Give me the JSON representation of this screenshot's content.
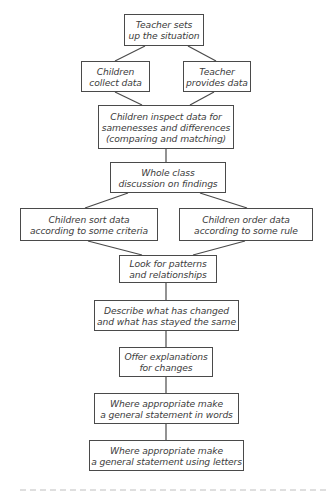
{
  "diagram": {
    "type": "flowchart",
    "colors": {
      "border": "#4a4a4a",
      "text": "#3c3c3c",
      "background": "#ffffff"
    },
    "nodes": {
      "setup": {
        "line1": "Teacher sets",
        "line2": "up the situation"
      },
      "collect": {
        "line1": "Children",
        "line2": "collect data"
      },
      "provide": {
        "line1": "Teacher",
        "line2": "provides data"
      },
      "inspect": {
        "line1": "Children inspect data for",
        "line2": "samenesses and differences",
        "line3": "(comparing and matching)"
      },
      "discuss": {
        "line1": "Whole class",
        "line2": "discussion on findings"
      },
      "sort": {
        "line1": "Children sort data",
        "line2": "according to some criteria"
      },
      "order": {
        "line1": "Children order data",
        "line2": "according to some rule"
      },
      "patterns": {
        "line1": "Look for patterns",
        "line2": "and relationships"
      },
      "describe": {
        "line1": "Describe what has changed",
        "line2": "and what has stayed the same"
      },
      "explain": {
        "line1": "Offer explanations",
        "line2": "for changes"
      },
      "words": {
        "line1": "Where appropriate make",
        "line2": "a general statement in words"
      },
      "letters": {
        "line1": "Where appropriate make",
        "line2": "a general statement using letters"
      }
    },
    "edges": [
      [
        "setup",
        "collect"
      ],
      [
        "setup",
        "provide"
      ],
      [
        "collect",
        "inspect"
      ],
      [
        "provide",
        "inspect"
      ],
      [
        "inspect",
        "discuss"
      ],
      [
        "discuss",
        "sort"
      ],
      [
        "discuss",
        "order"
      ],
      [
        "sort",
        "patterns"
      ],
      [
        "order",
        "patterns"
      ],
      [
        "patterns",
        "describe"
      ],
      [
        "describe",
        "explain"
      ],
      [
        "explain",
        "words"
      ],
      [
        "words",
        "letters"
      ]
    ]
  }
}
